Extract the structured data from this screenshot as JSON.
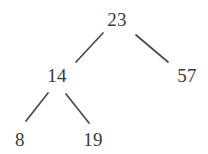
{
  "diagram": {
    "type": "binary-search-tree",
    "title": "",
    "background_color": "#ffffff",
    "edge_color": "#4a4a4a",
    "text_color": "#3a3a3a",
    "nodes": [
      {
        "id": "n23",
        "label": "23",
        "x": 117,
        "y": 19,
        "level": 0,
        "role": "root"
      },
      {
        "id": "n14",
        "label": "14",
        "x": 57,
        "y": 75,
        "level": 1,
        "role": "left-child"
      },
      {
        "id": "n57",
        "label": "57",
        "x": 187,
        "y": 75,
        "level": 1,
        "role": "right-child"
      },
      {
        "id": "n8",
        "label": "8",
        "x": 20,
        "y": 139,
        "level": 2,
        "role": "left-leaf"
      },
      {
        "id": "n19",
        "label": "19",
        "x": 93,
        "y": 139,
        "level": 2,
        "role": "right-leaf"
      }
    ],
    "edges": [
      {
        "id": "e23-14",
        "from": "n23",
        "to": "n14",
        "x1": 103,
        "y1": 33,
        "x2": 76,
        "y2": 62
      },
      {
        "id": "e23-57",
        "from": "n23",
        "to": "n57",
        "x1": 136,
        "y1": 35,
        "x2": 168,
        "y2": 62
      },
      {
        "id": "e14-8",
        "from": "n14",
        "to": "n8",
        "x1": 48,
        "y1": 93,
        "x2": 26,
        "y2": 121
      },
      {
        "id": "e14-19",
        "from": "n14",
        "to": "n19",
        "x1": 66,
        "y1": 94,
        "x2": 89,
        "y2": 123
      }
    ]
  }
}
